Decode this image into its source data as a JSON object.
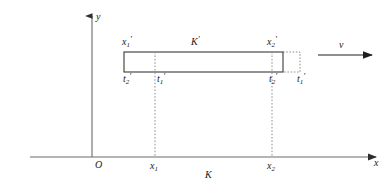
{
  "figure": {
    "stroke_color": "#3a3a3a",
    "axis_color": "#6b6b6b",
    "dotted_color": "#8a8a8a",
    "text_color": "#1a1a1a",
    "background": "#ffffff"
  },
  "axes": {
    "y_axis_label": "y",
    "x_axis_label": "x",
    "origin_label": "O"
  },
  "frames": {
    "moving_frame_label": "K",
    "moving_frame_prime": "′",
    "rest_frame_label": "K"
  },
  "labels": {
    "rod_left_top": {
      "base": "x",
      "sub": "1",
      "prime": "′"
    },
    "rod_right_top": {
      "base": "x",
      "sub": "2",
      "prime": "′"
    },
    "rod_left_time_outer": {
      "base": "t",
      "sub": "2",
      "prime": "′"
    },
    "rod_left_time_inner": {
      "base": "t",
      "sub": "1",
      "prime": "′"
    },
    "rod_right_time_inner": {
      "base": "t",
      "sub": "2",
      "prime": "′"
    },
    "rod_right_time_outer": {
      "base": "t",
      "sub": "1",
      "prime": "′"
    },
    "x_tick_1": {
      "base": "x",
      "sub": "1"
    },
    "x_tick_2": {
      "base": "x",
      "sub": "2"
    },
    "velocity": {
      "base": "v"
    }
  },
  "geometry": {
    "y_axis_x": 92,
    "x_axis_y": 157,
    "rect_left": 124,
    "rect_right": 283,
    "rect_top": 52,
    "rect_bottom": 72,
    "dotted_rect_right": 300,
    "dashed_x1": 155,
    "dashed_x2": 272,
    "velocity_arrow_x_start": 318,
    "velocity_arrow_x_end": 372,
    "velocity_arrow_y": 55
  }
}
